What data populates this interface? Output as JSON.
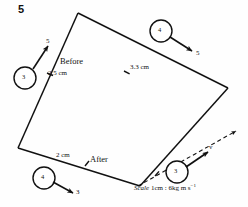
{
  "figure": {
    "question_number": "5",
    "labels": {
      "before": "Before",
      "after": "After",
      "side_before": "2.5 cm",
      "side_top_right": "3.3 cm",
      "side_after": "2 cm",
      "velocity_symbol": "v"
    },
    "scale_note": {
      "word": "Scale",
      "value": "1cm : 6kg m s",
      "exponent": "−1"
    },
    "bodies": [
      {
        "name": "incoming-mass-3",
        "mass": "3",
        "arrow_label": "5",
        "position": "left"
      },
      {
        "name": "incoming-mass-4",
        "mass": "4",
        "arrow_label": "5",
        "position": "top-right"
      },
      {
        "name": "outgoing-mass-4",
        "mass": "4",
        "arrow_label": "3",
        "position": "bottom-left"
      },
      {
        "name": "outgoing-mass-3",
        "mass": "3",
        "arrow_label": "v",
        "position": "bottom-right"
      }
    ],
    "colors": {
      "ink": "#111111",
      "paper": "#fefefe"
    }
  }
}
